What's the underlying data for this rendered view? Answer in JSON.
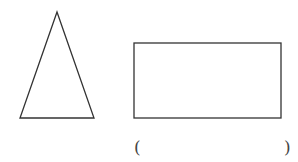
{
  "figure": {
    "shapes": [
      {
        "type": "triangle",
        "kind": "isosceles",
        "points": [
          [
            57,
            12
          ],
          [
            20,
            118
          ],
          [
            94,
            118
          ]
        ]
      },
      {
        "type": "rectangle",
        "x": 134,
        "y": 43,
        "width": 147,
        "height": 75
      }
    ],
    "answer_blank": {
      "open": "(",
      "close": ")",
      "value": ""
    },
    "stroke_color": "#333333"
  }
}
